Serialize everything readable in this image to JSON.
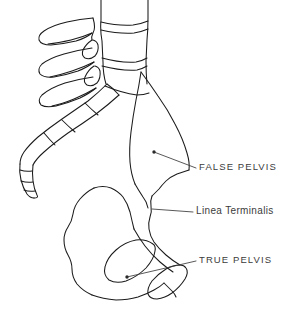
{
  "figure": {
    "background_color": "#ffffff",
    "ink_color": "#1b1b1b",
    "text_color": "#3b3b3b",
    "width": 287,
    "height": 318
  },
  "callouts": [
    {
      "id": "false-pelvis",
      "label": "FALSE PELVIS",
      "style": "uppercase",
      "text_x": 199,
      "text_y": 162,
      "leader_from_x": 196,
      "leader_from_y": 168,
      "leader_to_x": 154,
      "leader_to_y": 152,
      "marker": "dot"
    },
    {
      "id": "linea-terminalis",
      "label": "Linea Terminalis",
      "style": "titlecase",
      "text_x": 196,
      "text_y": 206,
      "leader_from_x": 193,
      "leader_from_y": 212,
      "leader_to_x": 152,
      "leader_to_y": 209,
      "marker": "none"
    },
    {
      "id": "true-pelvis",
      "label": "TRUE PELVIS",
      "style": "uppercase",
      "text_x": 199,
      "text_y": 255,
      "leader_from_x": 196,
      "leader_from_y": 261,
      "leader_to_x": 127,
      "leader_to_y": 277,
      "marker": "dot"
    }
  ],
  "anatomy": {
    "regions": [
      "lumbar-vertebrae",
      "spinous-processes",
      "sacrum",
      "coccyx",
      "iliac-wing",
      "pelvic-brim",
      "ischium",
      "obturator-foramen",
      "ischial-tuberosity"
    ]
  }
}
